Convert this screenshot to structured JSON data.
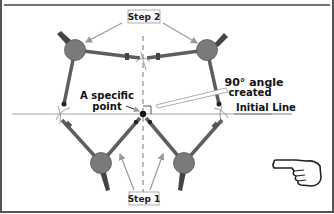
{
  "diagram": {
    "labels": {
      "step1": "Step 1",
      "step2": "Step 2",
      "specific_point_line1": "A specific",
      "specific_point_line2": "point",
      "angle_line1": "90° angle",
      "angle_line2": "created",
      "initial_line": "Initial Line"
    },
    "icons": {
      "pointer": "pointing-hand-icon"
    },
    "colors": {
      "ball": "#7a7a7a",
      "arm": "#5e5e5e",
      "arrow": "#9a9a9a",
      "line": "#8c8c8c",
      "frame": "#555555"
    }
  }
}
